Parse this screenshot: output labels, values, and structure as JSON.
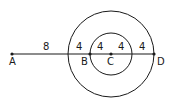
{
  "diagram": {
    "points": [
      {
        "id": "A",
        "label": "A",
        "x": 12,
        "y": 54
      },
      {
        "id": "B",
        "label": "B",
        "x": 90,
        "y": 54
      },
      {
        "id": "C",
        "label": "C",
        "x": 111,
        "y": 54
      },
      {
        "id": "D",
        "label": "D",
        "x": 154,
        "y": 54
      }
    ],
    "circles": [
      {
        "id": "outer",
        "center": "C",
        "radius_px": 43
      },
      {
        "id": "inner",
        "center": "C",
        "radius_px": 21
      }
    ],
    "segment_labels": [
      {
        "id": "A-outer",
        "text": "8"
      },
      {
        "id": "outer-B",
        "text": "4"
      },
      {
        "id": "B-C",
        "text": "4"
      },
      {
        "id": "C-inner",
        "text": "4"
      },
      {
        "id": "inner-D",
        "text": "4"
      }
    ],
    "colors": {
      "stroke": "#1a1a1a",
      "background": "#ffffff"
    }
  }
}
